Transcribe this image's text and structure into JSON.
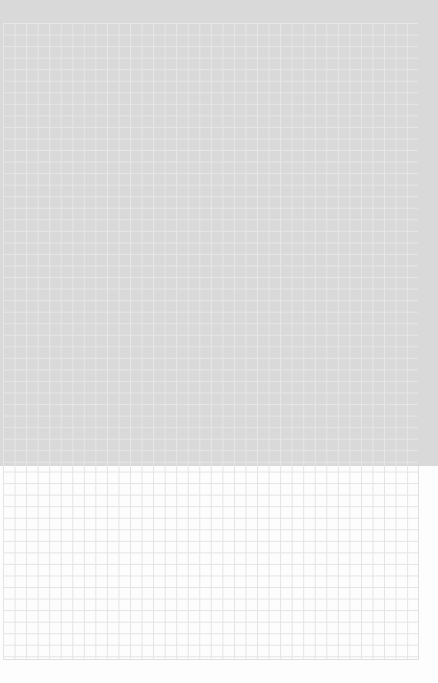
{
  "image": {
    "subject": "graph-paper",
    "grid_cell_px": 11.55,
    "colors": {
      "upper_background": "#d9d9d9",
      "lower_background": "#fdfdfd",
      "grid_line_on_gray": "#e6e6e6",
      "grid_line_on_white": "#e4e4e4"
    }
  }
}
